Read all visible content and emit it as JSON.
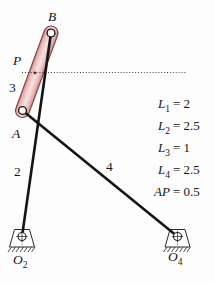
{
  "figure": {
    "type": "fourbar-linkage-diagram",
    "background_color": "#fdfdfd",
    "ink_color": "#161616",
    "coupler_fill_color": "#f3d2d2",
    "coupler_edge_color": "#7d4040"
  },
  "labels": {
    "B": "B",
    "P": "P",
    "A": "A",
    "link2": "2",
    "link3": "3",
    "link4": "4",
    "O2": {
      "base": "O",
      "sub": "2"
    },
    "O4": {
      "base": "O",
      "sub": "4"
    }
  },
  "equations": [
    {
      "lhs": "L",
      "sub": "1",
      "rhs": "= 2"
    },
    {
      "lhs": "L",
      "sub": "2",
      "rhs": "= 2.5"
    },
    {
      "lhs": "L",
      "sub": "3",
      "rhs": "= 1"
    },
    {
      "lhs": "L",
      "sub": "4",
      "rhs": "= 2.5"
    },
    {
      "lhs": "AP",
      "sub": "",
      "rhs": "= 0.5"
    }
  ]
}
